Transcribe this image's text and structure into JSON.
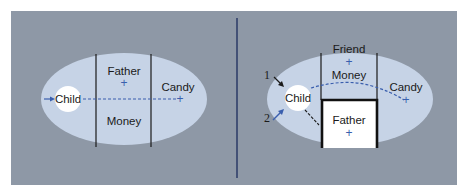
{
  "colors": {
    "panel": "#8e98a6",
    "field": "#c6d3e6",
    "child_circle": "#ffffff",
    "accent_blue": "#3a5fae",
    "divider": "#2a3a66",
    "barrier": "#111111"
  },
  "left_diagram": {
    "title": "",
    "regions": [
      {
        "label": "Child"
      },
      {
        "label": "Father"
      },
      {
        "label": "Money"
      },
      {
        "label": "Candy"
      }
    ],
    "valences": [
      "+",
      "+"
    ]
  },
  "right_diagram": {
    "regions": [
      {
        "label": "Child"
      },
      {
        "label": "Friend"
      },
      {
        "label": "Money"
      },
      {
        "label": "Candy"
      },
      {
        "label": "Father"
      }
    ],
    "valences": [
      "+",
      "+",
      "+"
    ],
    "path_numbers": [
      "1",
      "2"
    ]
  }
}
